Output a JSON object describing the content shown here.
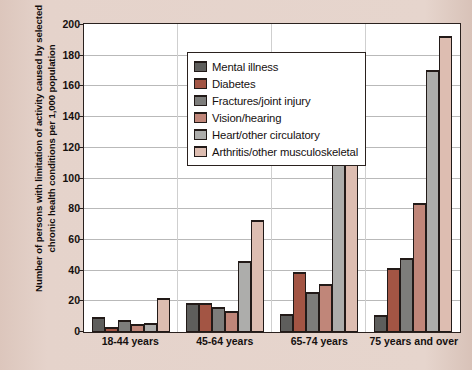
{
  "chart_data": {
    "type": "bar",
    "title": "",
    "xlabel": "",
    "ylabel": "Number of persons with limitation of activity caused by selected chronic health conditions per 1,000 population",
    "categories": [
      "18-44 years",
      "45-64 years",
      "65-74 years",
      "75 years and over"
    ],
    "ylim": [
      0,
      200
    ],
    "yticks": [
      0,
      20,
      40,
      60,
      80,
      100,
      120,
      140,
      160,
      180,
      200
    ],
    "grid": true,
    "legend_position": "upper-left-inside",
    "series": [
      {
        "name": "Mental illness",
        "color": "#5e5e5c",
        "values": [
          10,
          19,
          12,
          11
        ]
      },
      {
        "name": "Diabetes",
        "color": "#a35544",
        "values": [
          3,
          19,
          39,
          42
        ]
      },
      {
        "name": "Fractures/joint injury",
        "color": "#7d7d7b",
        "values": [
          8,
          16,
          26,
          48
        ]
      },
      {
        "name": "Vision/hearing",
        "color": "#c08679",
        "values": [
          5,
          14,
          31,
          84
        ]
      },
      {
        "name": "Heart/other circulatory",
        "color": "#adadab",
        "values": [
          6,
          46,
          111,
          171
        ]
      },
      {
        "name": "Arthritis/other musculoskeletal",
        "color": "#ddbdb1",
        "values": [
          22,
          73,
          118,
          193
        ]
      }
    ]
  },
  "colors": {
    "background": "#e3cfc6",
    "plot_background": "#ffffff",
    "axis": "#2a211e",
    "grid": "#b9b9b9"
  }
}
